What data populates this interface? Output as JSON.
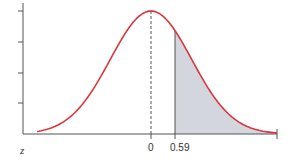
{
  "chart_data": {
    "type": "area",
    "title": "",
    "xlabel": "z",
    "ylabel": "",
    "distribution": "standard normal",
    "mean": 0,
    "sd": 1,
    "x_ticks": [
      {
        "value": 0,
        "label": "0"
      },
      {
        "value": 0.59,
        "label": "0.59"
      }
    ],
    "y_ticks_count": 4,
    "y_tick_labels": [],
    "shaded_region": {
      "from": 0.59,
      "to": "inf",
      "side": "right",
      "fill": "#d4d6de"
    },
    "reference_lines": [
      {
        "x": 0,
        "style": "dashed",
        "color": "#555555"
      },
      {
        "x": 0.59,
        "style": "solid",
        "color": "#555555"
      }
    ],
    "xlim": [
      -2.8,
      3.1
    ],
    "curve_color": "#d9363e",
    "grid": false,
    "legend": null
  },
  "labels": {
    "axis_var": "z",
    "tick_zero": "0",
    "tick_value": "0.59"
  }
}
